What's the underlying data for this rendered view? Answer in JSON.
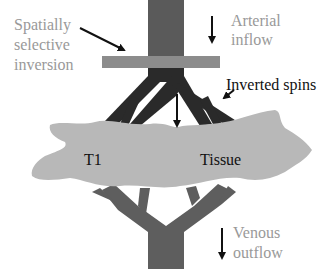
{
  "diagram": {
    "labels": {
      "spatially_selective_line1": "Spatially",
      "spatially_selective_line2": "selective",
      "spatially_selective_line3": "inversion",
      "arterial_line1": "Arterial",
      "arterial_line2": "inflow",
      "inverted_spins": "Inverted spins",
      "t1": "T1",
      "tissue": "Tissue",
      "venous_line1": "Venous",
      "venous_line2": "outflow"
    },
    "colors": {
      "artery_trunk": "#5a5a5a",
      "inverted_vessels": "#2a2a2a",
      "inversion_slab": "#8c8c8c",
      "tissue": "#b8b8b8",
      "veins": "#5e5e5e",
      "gray_text": "#999999",
      "dark_text": "#111111"
    }
  }
}
